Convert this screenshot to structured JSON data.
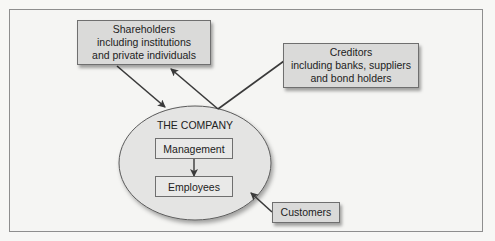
{
  "diagram": {
    "nodes": {
      "shareholders": {
        "lines": [
          "Shareholders",
          "including institutions",
          "and private individuals"
        ]
      },
      "creditors": {
        "lines": [
          "Creditors",
          "including banks, suppliers",
          "and bond holders"
        ]
      },
      "company": {
        "label": "THE COMPANY",
        "management": "Management",
        "employees": "Employees"
      },
      "customers": {
        "label": "Customers"
      }
    },
    "edges": [
      {
        "from": "shareholders",
        "to": "company",
        "arrow": "to"
      },
      {
        "from": "company",
        "to": "shareholders",
        "arrow": "to"
      },
      {
        "from": "company",
        "to": "creditors",
        "arrow": "none"
      },
      {
        "from": "customers",
        "to": "company",
        "arrow": "to"
      },
      {
        "from": "management",
        "to": "employees",
        "arrow": "to"
      }
    ],
    "colors": {
      "box_fill": "#dadad9",
      "ellipse_fill": "#e4e4e3",
      "line": "#3a3a3a",
      "frame_border": "#8e8e8e"
    }
  }
}
